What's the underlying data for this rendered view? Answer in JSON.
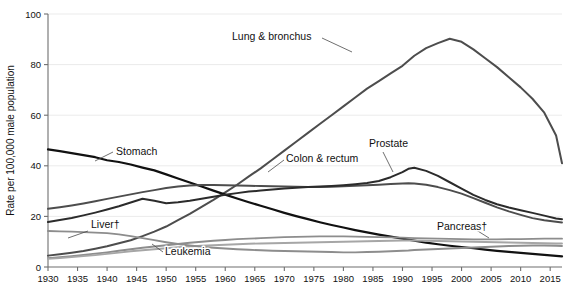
{
  "chart_data": {
    "type": "line",
    "title": "",
    "xlabel": "",
    "ylabel": "Rate per 100,000 male population",
    "xlim": [
      1930,
      2017
    ],
    "ylim": [
      0,
      100
    ],
    "grid": true,
    "legend_position": "inline-labels",
    "y_ticks": [
      0,
      20,
      40,
      60,
      80,
      100
    ],
    "x_ticks": [
      1930,
      1935,
      1940,
      1945,
      1950,
      1955,
      1960,
      1965,
      1970,
      1975,
      1980,
      1985,
      1990,
      1995,
      2000,
      2005,
      2010,
      2015
    ],
    "x": [
      1930,
      1932,
      1934,
      1936,
      1938,
      1940,
      1942,
      1944,
      1946,
      1948,
      1950,
      1952,
      1954,
      1956,
      1958,
      1960,
      1962,
      1964,
      1966,
      1968,
      1970,
      1972,
      1974,
      1976,
      1978,
      1980,
      1982,
      1984,
      1986,
      1988,
      1990,
      1991,
      1992,
      1994,
      1996,
      1998,
      2000,
      2002,
      2004,
      2006,
      2008,
      2010,
      2012,
      2014,
      2016,
      2017
    ],
    "series": [
      {
        "name": "Lung & bronchus",
        "color": "#4d4d4d",
        "width": 2.0,
        "label": "Lung & bronchus",
        "label_xy": [
          232,
          40
        ],
        "leader": [
          [
            322,
            38
          ],
          [
            352,
            52
          ]
        ],
        "values": [
          4.5,
          5.0,
          5.6,
          6.3,
          7.2,
          8.2,
          9.4,
          10.6,
          12.2,
          14.0,
          16.0,
          18.5,
          21.0,
          23.8,
          26.5,
          29.5,
          32.5,
          35.8,
          39.0,
          42.5,
          46.0,
          49.5,
          53.0,
          56.5,
          60.0,
          63.5,
          67.0,
          70.5,
          73.5,
          76.5,
          79.5,
          81.5,
          83.5,
          86.5,
          88.5,
          90.2,
          89.0,
          86.0,
          82.5,
          79.0,
          75.0,
          71.0,
          66.5,
          61.0,
          52.0,
          41.0
        ]
      },
      {
        "name": "Stomach",
        "color": "#111111",
        "width": 2.2,
        "label": "Stomach",
        "label_xy": [
          116,
          155
        ],
        "leader": [
          [
            113,
            152
          ],
          [
            95,
            161
          ]
        ],
        "values": [
          46.5,
          45.8,
          45.0,
          44.2,
          43.4,
          42.2,
          41.5,
          40.5,
          39.3,
          38.2,
          36.6,
          35.0,
          33.4,
          31.8,
          30.2,
          28.6,
          27.1,
          25.6,
          24.2,
          22.8,
          21.4,
          20.1,
          18.9,
          17.7,
          16.6,
          15.6,
          14.6,
          13.7,
          12.8,
          12.0,
          11.2,
          10.8,
          10.4,
          9.6,
          9.0,
          8.4,
          7.9,
          7.4,
          6.9,
          6.4,
          6.0,
          5.6,
          5.2,
          4.8,
          4.4,
          4.2
        ]
      },
      {
        "name": "Colon & rectum",
        "color": "#4d4d4d",
        "width": 1.9,
        "label": "Colon & rectum",
        "label_xy": [
          286,
          162
        ],
        "leader": [
          [
            284,
            160
          ],
          [
            268,
            172
          ]
        ],
        "values": [
          23.0,
          23.6,
          24.3,
          25.1,
          26.0,
          26.9,
          27.8,
          28.7,
          29.6,
          30.4,
          31.2,
          31.8,
          32.2,
          32.4,
          32.4,
          32.3,
          32.2,
          32.1,
          32.0,
          31.9,
          31.8,
          31.7,
          31.6,
          31.6,
          31.7,
          31.9,
          32.1,
          32.3,
          32.5,
          32.8,
          33.0,
          33.1,
          33.0,
          32.5,
          31.6,
          30.4,
          29.0,
          27.2,
          25.4,
          23.6,
          22.0,
          20.6,
          19.3,
          18.5,
          17.9,
          17.6
        ]
      },
      {
        "name": "Prostate",
        "color": "#2b2b2b",
        "width": 2.0,
        "label": "Prostate",
        "label_xy": [
          369,
          147
        ],
        "leader": [
          [
            383,
            152
          ],
          [
            393,
            172
          ]
        ],
        "values": [
          17.8,
          18.6,
          19.4,
          20.4,
          21.5,
          22.7,
          24.0,
          25.5,
          27.0,
          26.2,
          25.2,
          25.6,
          26.2,
          27.0,
          27.8,
          28.6,
          29.2,
          29.8,
          30.2,
          30.6,
          31.0,
          31.3,
          31.6,
          31.8,
          32.0,
          32.3,
          32.7,
          33.2,
          34.0,
          35.5,
          37.5,
          38.8,
          39.2,
          38.0,
          36.0,
          33.5,
          31.0,
          28.5,
          26.5,
          24.8,
          23.5,
          22.4,
          21.4,
          20.3,
          19.2,
          18.9
        ]
      },
      {
        "name": "Pancreas",
        "color": "#8d8d8d",
        "width": 1.9,
        "label": "Pancreas†",
        "label_xy": [
          437,
          230
        ],
        "leader": [
          [
            473,
            228
          ],
          [
            489,
            238
          ]
        ],
        "values": [
          3.5,
          3.9,
          4.3,
          4.8,
          5.3,
          5.8,
          6.4,
          7.0,
          7.6,
          8.1,
          8.6,
          9.1,
          9.6,
          10.0,
          10.4,
          10.7,
          11.0,
          11.2,
          11.4,
          11.6,
          11.8,
          11.9,
          12.0,
          12.1,
          12.1,
          12.1,
          12.0,
          11.9,
          11.8,
          11.7,
          11.6,
          11.5,
          11.4,
          11.3,
          11.2,
          11.1,
          11.0,
          10.9,
          10.9,
          10.9,
          11.0,
          11.0,
          11.1,
          11.2,
          11.2,
          11.2
        ]
      },
      {
        "name": "Leukemia",
        "color": "#a6a6a6",
        "width": 1.9,
        "label": "Leukemia",
        "label_xy": [
          165,
          255
        ],
        "leader": [
          [
            163,
            252
          ],
          [
            152,
            244
          ]
        ],
        "values": [
          3.2,
          3.5,
          3.9,
          4.3,
          4.7,
          5.2,
          5.7,
          6.2,
          6.6,
          7.0,
          7.4,
          7.8,
          8.1,
          8.4,
          8.6,
          8.8,
          9.0,
          9.2,
          9.3,
          9.4,
          9.5,
          9.6,
          9.7,
          9.8,
          9.9,
          10.0,
          10.1,
          10.2,
          10.3,
          10.4,
          10.5,
          10.5,
          10.5,
          10.4,
          10.3,
          10.2,
          10.1,
          10.0,
          9.9,
          9.8,
          9.7,
          9.6,
          9.5,
          9.4,
          9.3,
          9.3
        ]
      },
      {
        "name": "Liver",
        "color": "#8d8d8d",
        "width": 1.9,
        "label": "Liver†",
        "label_xy": [
          91,
          228
        ],
        "leader": [
          [
            88,
            231
          ],
          [
            68,
            238
          ]
        ],
        "values": [
          14.2,
          14.1,
          14.0,
          13.8,
          13.6,
          13.4,
          12.9,
          12.2,
          11.4,
          10.6,
          9.8,
          9.1,
          8.5,
          8.0,
          7.6,
          7.3,
          7.0,
          6.8,
          6.6,
          6.4,
          6.3,
          6.2,
          6.1,
          6.0,
          5.9,
          5.8,
          5.8,
          5.9,
          6.0,
          6.2,
          6.4,
          6.5,
          6.7,
          6.9,
          7.1,
          7.3,
          7.5,
          7.7,
          7.9,
          8.1,
          8.3,
          8.4,
          8.5,
          8.5,
          8.4,
          8.3
        ]
      }
    ]
  },
  "axis": {
    "y_title": "Rate per 100,000 male population"
  }
}
